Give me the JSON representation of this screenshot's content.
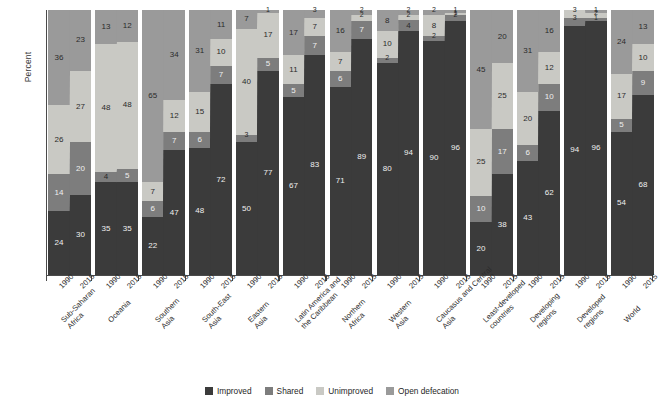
{
  "axis": {
    "ylabel": "Percent",
    "years": [
      "1990",
      "2015"
    ]
  },
  "legend": {
    "items": [
      {
        "label": "Improved",
        "color": "#3b3b3b"
      },
      {
        "label": "Shared",
        "color": "#7d7d7d"
      },
      {
        "label": "Unimproved",
        "color": "#c9c9c4"
      },
      {
        "label": "Open defecation",
        "color": "#9a9a9a"
      }
    ]
  },
  "colors": {
    "improved": "#3b3b3b",
    "shared": "#7d7d7d",
    "unimproved": "#c9c9c4",
    "open_defecation": "#9a9a9a",
    "axis": "#4a4a4a",
    "background": "#ffffff"
  },
  "source_note": "",
  "chart_data": {
    "type": "bar",
    "subtype": "stacked-100-percent-paired",
    "title": "",
    "xlabel": "",
    "ylabel": "Percent",
    "ylim": [
      0,
      100
    ],
    "grid": false,
    "legend_position": "bottom",
    "categories": [
      "Sub-Saharan Africa",
      "Oceania",
      "Southern Asia",
      "South-East Asia",
      "Eastern Asia",
      "Latin America and the Caribbean",
      "Northern Africa",
      "Western Asia",
      "Caucasus and Central Asia",
      "Least-developed countries",
      "Developing regions",
      "Developed regions",
      "World"
    ],
    "years": [
      "1990",
      "2015"
    ],
    "stack_order": [
      "Improved",
      "Shared",
      "Unimproved",
      "Open defecation"
    ],
    "series": [
      {
        "name": "Improved",
        "values_1990": [
          24,
          35,
          22,
          47,
          50,
          67,
          71,
          80,
          90,
          20,
          43,
          94,
          54
        ],
        "values_2015": [
          30,
          35,
          47,
          48,
          77,
          83,
          89,
          94,
          96,
          38,
          62,
          96,
          68
        ]
      },
      {
        "name": "Shared",
        "values_1990": [
          14,
          4,
          6,
          6,
          3,
          5,
          6,
          2,
          2,
          10,
          6,
          3,
          5
        ]
      },
      {
        "name": "Shared_2015",
        "values_2015": [
          20,
          5,
          7,
          12,
          5,
          7,
          7,
          4,
          2,
          17,
          10,
          1,
          9
        ]
      },
      {
        "name": "Unimproved",
        "values_1990": [
          26,
          48,
          7,
          15,
          40,
          11,
          7,
          10,
          8,
          25,
          20,
          3,
          17
        ]
      },
      {
        "name": "Unimproved_2015",
        "values_2015": [
          27,
          48,
          12,
          10,
          17,
          7,
          2,
          2,
          1,
          25,
          12,
          2,
          10
        ]
      },
      {
        "name": "Open defecation",
        "values_1990": [
          36,
          13,
          65,
          31,
          7,
          17,
          16,
          8,
          2,
          45,
          31,
          3,
          24
        ]
      },
      {
        "name": "Open defecation_2015",
        "values_2015": [
          23,
          12,
          34,
          11,
          1,
          3,
          2,
          2,
          1,
          20,
          16,
          2,
          13
        ]
      }
    ],
    "groups": [
      {
        "category": "Sub-Saharan Africa",
        "bars": [
          {
            "year": "1990",
            "improved": 24,
            "shared": 14,
            "unimproved": 26,
            "open_defecation": 36
          },
          {
            "year": "2015",
            "improved": 30,
            "shared": 20,
            "unimproved": 27,
            "open_defecation": 23
          }
        ]
      },
      {
        "category": "Oceania",
        "bars": [
          {
            "year": "1990",
            "improved": 35,
            "shared": 4,
            "unimproved": 48,
            "open_defecation": 13
          },
          {
            "year": "2015",
            "improved": 35,
            "shared": 5,
            "unimproved": 48,
            "open_defecation": 12
          }
        ]
      },
      {
        "category": "Southern Asia",
        "bars": [
          {
            "year": "1990",
            "improved": 22,
            "shared": 6,
            "unimproved": 7,
            "open_defecation": 65
          },
          {
            "year": "2015",
            "improved": 47,
            "shared": 7,
            "unimproved": 12,
            "open_defecation": 34
          }
        ]
      },
      {
        "category": "South-East Asia",
        "bars": [
          {
            "year": "1990",
            "improved": 48,
            "shared": 6,
            "unimproved": 15,
            "open_defecation": 31
          },
          {
            "year": "2015",
            "improved": 72,
            "shared": 7,
            "unimproved": 10,
            "open_defecation": 11
          }
        ]
      },
      {
        "category": "Eastern Asia",
        "bars": [
          {
            "year": "1990",
            "improved": 50,
            "shared": 3,
            "unimproved": 40,
            "open_defecation": 7
          },
          {
            "year": "2015",
            "improved": 77,
            "shared": 5,
            "unimproved": 17,
            "open_defecation": 1
          }
        ]
      },
      {
        "category": "Latin America and the Caribbean",
        "bars": [
          {
            "year": "1990",
            "improved": 67,
            "shared": 5,
            "unimproved": 11,
            "open_defecation": 17
          },
          {
            "year": "2015",
            "improved": 83,
            "shared": 7,
            "unimproved": 7,
            "open_defecation": 3
          }
        ]
      },
      {
        "category": "Northern Africa",
        "bars": [
          {
            "year": "1990",
            "improved": 71,
            "shared": 6,
            "unimproved": 7,
            "open_defecation": 16
          },
          {
            "year": "2015",
            "improved": 89,
            "shared": 7,
            "unimproved": 2,
            "open_defecation": 2
          }
        ]
      },
      {
        "category": "Western Asia",
        "bars": [
          {
            "year": "1990",
            "improved": 80,
            "shared": 2,
            "unimproved": 10,
            "open_defecation": 8
          },
          {
            "year": "2015",
            "improved": 94,
            "shared": 4,
            "unimproved": 2,
            "open_defecation": 2
          }
        ]
      },
      {
        "category": "Caucasus and Central Asia",
        "bars": [
          {
            "year": "1990",
            "improved": 90,
            "shared": 2,
            "unimproved": 8,
            "open_defecation": 2
          },
          {
            "year": "2015",
            "improved": 96,
            "shared": 2,
            "unimproved": 1,
            "open_defecation": 1
          }
        ]
      },
      {
        "category": "Least-developed countries",
        "bars": [
          {
            "year": "1990",
            "improved": 20,
            "shared": 10,
            "unimproved": 25,
            "open_defecation": 45
          },
          {
            "year": "2015",
            "improved": 38,
            "shared": 17,
            "unimproved": 25,
            "open_defecation": 20
          }
        ]
      },
      {
        "category": "Developing regions",
        "bars": [
          {
            "year": "1990",
            "improved": 43,
            "shared": 6,
            "unimproved": 20,
            "open_defecation": 31
          },
          {
            "year": "2015",
            "improved": 62,
            "shared": 10,
            "unimproved": 12,
            "open_defecation": 16
          }
        ]
      },
      {
        "category": "Developed regions",
        "bars": [
          {
            "year": "1990",
            "improved": 94,
            "shared": 3,
            "unimproved": 3,
            "open_defecation": 0
          },
          {
            "year": "2015",
            "improved": 96,
            "shared": 1,
            "unimproved": 2,
            "open_defecation": 1
          }
        ]
      },
      {
        "category": "World",
        "bars": [
          {
            "year": "1990",
            "improved": 54,
            "shared": 5,
            "unimproved": 17,
            "open_defecation": 24
          },
          {
            "year": "2015",
            "improved": 68,
            "shared": 9,
            "unimproved": 10,
            "open_defecation": 13
          }
        ]
      }
    ]
  }
}
